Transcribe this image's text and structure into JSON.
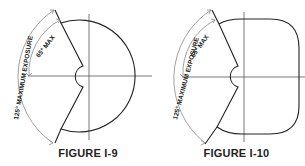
{
  "figures": [
    {
      "caption": "FIGURE I-9",
      "shape": "circle",
      "labels": {
        "max_angle": "65° MAX",
        "max_exposure": "125° MAXIMUM EXPOSURE"
      }
    },
    {
      "caption": "FIGURE I-10",
      "shape": "rounded-square",
      "labels": {
        "max_angle": "65° MAX",
        "max_exposure": "125° MAXIMUM EXPOSURE"
      }
    }
  ],
  "colors": {
    "outline": "#222222",
    "axis": "#555555",
    "dimension": "#888888"
  }
}
